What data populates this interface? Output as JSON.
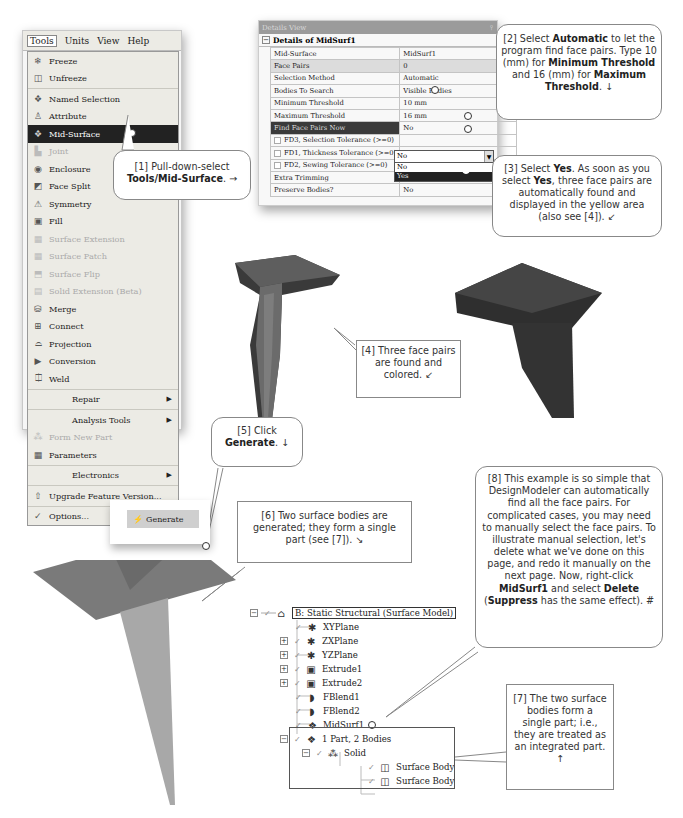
{
  "menu": {
    "menubar": [
      "Tools",
      "Units",
      "View",
      "Help"
    ],
    "items": [
      {
        "label": "Freeze",
        "icon": "freeze-icon",
        "state": "normal"
      },
      {
        "label": "Unfreeze",
        "icon": "unfreeze-icon",
        "state": "normal"
      },
      {
        "label": "Named Selection",
        "icon": "named-selection-icon",
        "state": "normal"
      },
      {
        "label": "Attribute",
        "icon": "attribute-icon",
        "state": "normal"
      },
      {
        "label": "Mid-Surface",
        "icon": "mid-surface-icon",
        "state": "selected"
      },
      {
        "label": "Joint",
        "icon": "joint-icon",
        "state": "disabled"
      },
      {
        "label": "Enclosure",
        "icon": "enclosure-icon",
        "state": "normal"
      },
      {
        "label": "Face Split",
        "icon": "face-split-icon",
        "state": "normal"
      },
      {
        "label": "Symmetry",
        "icon": "symmetry-icon",
        "state": "normal"
      },
      {
        "label": "Fill",
        "icon": "fill-icon",
        "state": "normal"
      },
      {
        "label": "Surface Extension",
        "icon": "surface-extension-icon",
        "state": "disabled"
      },
      {
        "label": "Surface Patch",
        "icon": "surface-patch-icon",
        "state": "disabled"
      },
      {
        "label": "Surface Flip",
        "icon": "surface-flip-icon",
        "state": "disabled"
      },
      {
        "label": "Solid Extension (Beta)",
        "icon": "solid-extension-icon",
        "state": "disabled"
      },
      {
        "label": "Merge",
        "icon": "merge-icon",
        "state": "normal"
      },
      {
        "label": "Connect",
        "icon": "connect-icon",
        "state": "normal"
      },
      {
        "label": "Projection",
        "icon": "projection-icon",
        "state": "normal"
      },
      {
        "label": "Conversion",
        "icon": "conversion-icon",
        "state": "normal"
      },
      {
        "label": "Weld",
        "icon": "weld-icon",
        "state": "normal"
      }
    ],
    "repair": "Repair",
    "analysis_tools": "Analysis Tools",
    "form_new_part": "Form New Part",
    "parameters": "Parameters",
    "electronics": "Electronics",
    "upgrade": "Upgrade Feature Version...",
    "options": "Options..."
  },
  "details": {
    "panel_title": "Details View",
    "pin": "ⴲ",
    "header": "Details of MidSurf1",
    "rows": [
      {
        "key": "Mid-Surface",
        "value": "MidSurf1",
        "style": "normal"
      },
      {
        "key": "Face Pairs",
        "value": "0",
        "style": "gray"
      },
      {
        "key": "Selection Method",
        "value": "Automatic",
        "style": "normal"
      },
      {
        "key": "Bodies To Search",
        "value": "Visible Bodies",
        "style": "normal"
      },
      {
        "key": "Minimum Threshold",
        "value": "10 mm",
        "style": "normal"
      },
      {
        "key": "Maximum Threshold",
        "value": "16 mm",
        "style": "normal"
      },
      {
        "key": "Find Face Pairs Now",
        "value": "No",
        "style": "dark"
      },
      {
        "key": "FD3, Selection Tolerance (>=0)",
        "value": "",
        "style": "check"
      },
      {
        "key": "FD1, Thickness Tolerance (>=0)",
        "value": "0.0005 mm",
        "style": "check"
      },
      {
        "key": "FD2, Sewing Tolerance (>=0)",
        "value": "0.02 mm",
        "style": "check"
      },
      {
        "key": "Extra Trimming",
        "value": "Intersect Untrimmed with Body",
        "style": "normal"
      },
      {
        "key": "Preserve Bodies?",
        "value": "No",
        "style": "normal"
      }
    ],
    "dropdown_options": [
      "No",
      "Yes"
    ],
    "dropdown_selected": "Yes"
  },
  "callouts": {
    "c1": {
      "num": "[1] Pull-down-select",
      "bold": "Tools/Mid-Surface",
      "tail": ". →"
    },
    "c2": {
      "a": "[2] Select ",
      "b1": "Automatic",
      "c": " to let the program find face pairs. Type 10 (mm) for ",
      "b2": "Minimum Threshold",
      "d": " and 16 (mm) for ",
      "b3": "Maximum Threshold",
      "e": ". ↓"
    },
    "c3": {
      "a": "[3] Select ",
      "b1": "Yes",
      "c": ". As soon as you select ",
      "b2": "Yes",
      "d": ", three face pairs are automatically found and displayed in the yellow area (also see [4]). ↙"
    },
    "c4": {
      "text": "[4] Three face pairs are found and colored. ↙"
    },
    "c5": {
      "a": "[5] Click",
      "b": "Generate",
      "c": ". ↓"
    },
    "c6": {
      "text": "[6] Two surface bodies are generated; they form a single part (see [7]). ↘"
    },
    "c7": {
      "text": "[7] The two surface bodies form a single part; i.e., they are treated as an integrated part. ↑"
    },
    "c8": {
      "a": "[8] This example is so simple that DesignModeler can automatically find all the face pairs.  For complicated cases, you may need to manually select the face pairs.  To illustrate manual selection, let's delete what we've done on this page, and redo it manually on the next page.  Now, right-click ",
      "b1": "MidSurf1",
      "c": " and select ",
      "b2": "Delete",
      "d": " (",
      "b3": "Suppress",
      "e": " has the same effect).  #"
    }
  },
  "generate_button": {
    "label": "Generate",
    "icon": "lightning-icon"
  },
  "tree": {
    "root": "B: Static Structural (Surface Model)",
    "nodes": [
      {
        "label": "XYPlane",
        "expand": false
      },
      {
        "label": "ZXPlane",
        "expand": true
      },
      {
        "label": "YZPlane",
        "expand": true
      },
      {
        "label": "Extrude1",
        "expand": true
      },
      {
        "label": "Extrude2",
        "expand": true
      },
      {
        "label": "FBlend1",
        "expand": false
      },
      {
        "label": "FBlend2",
        "expand": false
      },
      {
        "label": "MidSurf1",
        "expand": false
      }
    ],
    "part": "1 Part, 2 Bodies",
    "solid": "Solid",
    "bodies": [
      "Surface Body",
      "Surface Body"
    ]
  },
  "colors": {
    "menu_bg": "#ecebe5",
    "selected_bg": "#222222",
    "model_dark": "#3c3c3c",
    "model_mid": "#6a6a6a",
    "surface_gray": "#7a7a7a"
  }
}
